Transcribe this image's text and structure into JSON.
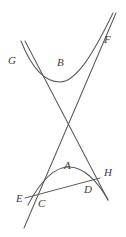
{
  "figure": {
    "width": 126,
    "height": 237,
    "background_color": "#ffffff",
    "stroke_color": "#5b5b5b",
    "label_color": "#3a3a3a"
  },
  "labels": {
    "a": "A",
    "b": "B",
    "c": "C",
    "d": "D",
    "e": "E",
    "f": "F",
    "g": "G",
    "h": "H"
  },
  "label_positions": {
    "a": {
      "x": 64,
      "y": 160
    },
    "b": {
      "x": 57,
      "y": 57
    },
    "c": {
      "x": 38,
      "y": 198
    },
    "d": {
      "x": 84,
      "y": 184
    },
    "e": {
      "x": 16,
      "y": 193
    },
    "f": {
      "x": 104,
      "y": 34
    },
    "g": {
      "x": 8,
      "y": 55
    },
    "h": {
      "x": 104,
      "y": 167
    }
  },
  "chart_data": {
    "type": "line",
    "xlabel": "",
    "ylabel": "",
    "grid": false,
    "legend": "none",
    "elements": [
      {
        "name": "upper-branch",
        "kind": "hyperbola-branch",
        "opens": "up",
        "vertex_label": "B",
        "endpoint_labels": [
          "G",
          "F"
        ],
        "path": "M 21,41 C 32,69 45,82 60,82 C 77,82 95,50 113,13"
      },
      {
        "name": "lower-branch",
        "kind": "hyperbola-branch",
        "opens": "down",
        "vertex_label": "A",
        "endpoint_labels": [
          "C",
          "D"
        ],
        "path": "M 28,205 C 42,178 56,167 69,167 C 83,167 97,180 108,200"
      },
      {
        "name": "asymptote-left",
        "kind": "line",
        "from": {
          "x": 25,
          "y": 41
        },
        "to": {
          "x": 108,
          "y": 200
        }
      },
      {
        "name": "asymptote-right",
        "kind": "line",
        "from": {
          "x": 116,
          "y": 13
        },
        "to": {
          "x": 24,
          "y": 228
        }
      },
      {
        "name": "secant-line",
        "kind": "line",
        "from": {
          "x": 25,
          "y": 198
        },
        "to": {
          "x": 100,
          "y": 178
        }
      }
    ]
  }
}
